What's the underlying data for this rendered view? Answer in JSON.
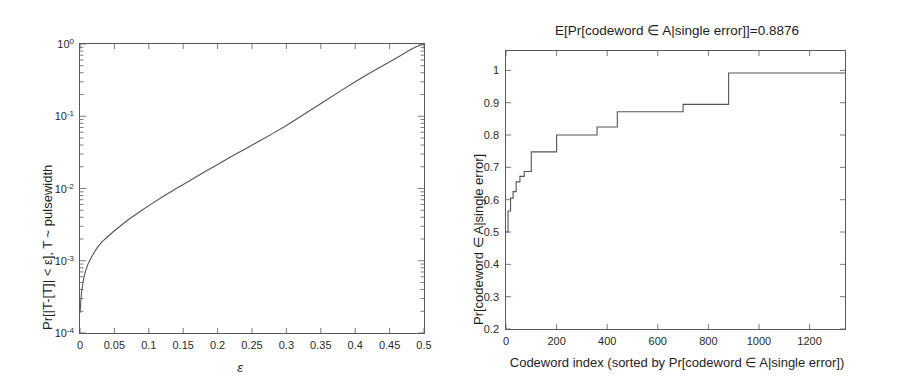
{
  "figure": {
    "background": "#ffffff",
    "line_color": "#555555",
    "axis_color": "#5a5a5a"
  },
  "left_panel": {
    "xlabel": "ε",
    "ylabel": "Pr[|T-[T]| < ε], T ~ pulsewidth",
    "xticks": [
      "0",
      "0.05",
      "0.1",
      "0.15",
      "0.2",
      "0.25",
      "0.3",
      "0.35",
      "0.4",
      "0.45",
      "0.5"
    ],
    "yticks": [
      "10",
      "10",
      "10",
      "10",
      "10"
    ],
    "yexponents": [
      "0",
      "-1",
      "-2",
      "-3",
      "-4"
    ]
  },
  "right_panel": {
    "title": "E[Pr[codeword ∈ A|single error]]=0.8876",
    "xlabel": "Codeword index (sorted by Pr[codeword ∈ A|single error])",
    "ylabel": "Pr[codeword ∈ A|single error]",
    "xticks": [
      "0",
      "200",
      "400",
      "600",
      "800",
      "1000",
      "1200"
    ],
    "yticks": [
      "0.2",
      "0.3",
      "0.4",
      "0.5",
      "0.6",
      "0.7",
      "0.8",
      "0.9",
      "1"
    ]
  },
  "chart_data": [
    {
      "type": "line",
      "panel": "left",
      "title": "",
      "xlabel": "ε",
      "ylabel": "Pr[|T-[T]| < ε], T ~ pulsewidth",
      "xlim": [
        0,
        0.5
      ],
      "ylim": [
        0.0001,
        1
      ],
      "yscale": "log",
      "xscale": "linear",
      "grid": false,
      "legend": "none",
      "xticks": [
        0,
        0.05,
        0.1,
        0.15,
        0.2,
        0.25,
        0.3,
        0.35,
        0.4,
        0.45,
        0.5
      ],
      "yticks": [
        0.0001,
        0.001,
        0.01,
        0.1,
        1
      ],
      "series": [
        {
          "name": "Pr[|T-[T]| < eps]",
          "x": [
            0.0,
            0.002,
            0.005,
            0.008,
            0.012,
            0.018,
            0.025,
            0.032,
            0.04,
            0.05,
            0.06,
            0.07,
            0.08,
            0.09,
            0.1,
            0.12,
            0.14,
            0.16,
            0.18,
            0.2,
            0.22,
            0.24,
            0.26,
            0.28,
            0.3,
            0.32,
            0.34,
            0.36,
            0.38,
            0.4,
            0.42,
            0.44,
            0.46,
            0.48,
            0.49,
            0.5
          ],
          "y": [
            0.00019,
            0.00035,
            0.00055,
            0.00072,
            0.00092,
            0.00118,
            0.00152,
            0.00182,
            0.00215,
            0.0026,
            0.0031,
            0.0037,
            0.0043,
            0.005,
            0.0058,
            0.0077,
            0.01,
            0.0129,
            0.0168,
            0.0215,
            0.0277,
            0.0352,
            0.045,
            0.0575,
            0.0745,
            0.0985,
            0.13,
            0.172,
            0.228,
            0.3,
            0.39,
            0.5,
            0.64,
            0.83,
            0.93,
            1.0
          ]
        }
      ]
    },
    {
      "type": "line",
      "panel": "right",
      "style": "step",
      "title": "E[Pr[codeword ∈ A|single error]]=0.8876",
      "xlabel": "Codeword index (sorted by Pr[codeword ∈ A|single error])",
      "ylabel": "Pr[codeword ∈ A|single error]",
      "xlim": [
        0,
        1340
      ],
      "ylim": [
        0.2,
        1.06
      ],
      "yscale": "linear",
      "xscale": "linear",
      "grid": false,
      "legend": "none",
      "xticks": [
        0,
        200,
        400,
        600,
        800,
        1000,
        1200
      ],
      "yticks": [
        0.2,
        0.3,
        0.4,
        0.5,
        0.6,
        0.7,
        0.8,
        0.9,
        1
      ],
      "annotation": "E[Pr[codeword ∈ A|single error]]=0.8876",
      "series": [
        {
          "name": "Pr[codeword ∈ A|single error] (sorted)",
          "x": [
            0,
            8,
            8,
            18,
            18,
            28,
            28,
            40,
            40,
            55,
            55,
            72,
            72,
            100,
            100,
            200,
            200,
            360,
            360,
            440,
            440,
            700,
            700,
            880,
            880,
            1340
          ],
          "y": [
            0.5,
            0.5,
            0.565,
            0.565,
            0.605,
            0.605,
            0.625,
            0.625,
            0.655,
            0.655,
            0.672,
            0.672,
            0.687,
            0.687,
            0.748,
            0.748,
            0.8,
            0.8,
            0.825,
            0.825,
            0.872,
            0.872,
            0.895,
            0.895,
            0.992,
            0.992
          ]
        }
      ]
    }
  ]
}
